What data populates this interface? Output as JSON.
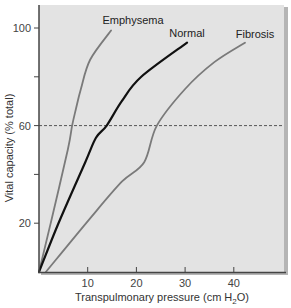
{
  "chart_data": {
    "type": "line",
    "title": "",
    "xlabel": "Transpulmonary pressure (cm H2O)",
    "xlabel_parts": {
      "pre": "Transpulmonary pressure (cm H",
      "sub": "2",
      "post": "O)"
    },
    "ylabel": "Vital capacity (% total)",
    "xlim": [
      0,
      50
    ],
    "ylim": [
      0,
      110
    ],
    "x_ticks": [
      10,
      20,
      30,
      40
    ],
    "x_tick_labels": [
      "10",
      "20",
      "30",
      "40"
    ],
    "y_ticks": [
      20,
      40,
      60,
      80,
      100
    ],
    "y_tick_labels": [
      "20",
      "",
      "60",
      "",
      "100"
    ],
    "grid": false,
    "reference_line": {
      "y": 60,
      "style": "dashed"
    },
    "legend": "inline labels",
    "series": [
      {
        "name": "Emphysema",
        "color": "#7a7a7a",
        "x": [
          0,
          2.4,
          5.9,
          6.8,
          7.6,
          8.6,
          10.5,
          14.8
        ],
        "y": [
          0,
          20,
          50,
          60,
          67,
          75,
          87,
          99
        ]
      },
      {
        "name": "Normal",
        "color": "#111111",
        "x": [
          0,
          4,
          9.5,
          11.7,
          13.9,
          17,
          21,
          30.4
        ],
        "y": [
          0,
          20,
          45,
          55,
          60,
          70,
          80,
          94
        ]
      },
      {
        "name": "Fibrosis",
        "color": "#7a7a7a",
        "x": [
          1.4,
          10.5,
          17,
          21.6,
          24.2,
          30,
          36,
          42.3
        ],
        "y": [
          0,
          22,
          37,
          45,
          60,
          75,
          86,
          94
        ]
      }
    ]
  },
  "colors": {
    "plot_bg": "#e3e3e3",
    "axis": "#444444",
    "shadow": "#b5b5b5"
  }
}
